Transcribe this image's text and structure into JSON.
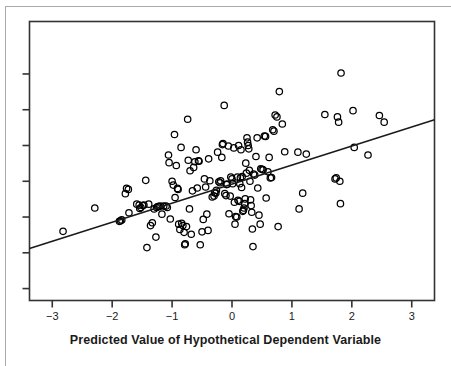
{
  "figure": {
    "kind": "scatterplot-with-regression-line",
    "background_color": "#ffffff",
    "frame_color": "#333333",
    "point_color": "#000000",
    "line_color": "#1a1a1a",
    "page_rule_color": "#a9a9a9"
  },
  "axis": {
    "x_title": "Predicted Value of Hypothetical Dependent Variable",
    "x_tick_labels": [
      "-3",
      "-2",
      "-1",
      "0",
      "1",
      "2",
      "3"
    ],
    "y_tick_labels": [
      "",
      "",
      "",
      "",
      "",
      "",
      ""
    ]
  },
  "chart_data": {
    "type": "scatter",
    "title": "",
    "subtitle": "",
    "xlabel": "Predicted Value of Hypothetical Dependent Variable",
    "ylabel": "",
    "xlim": [
      -3.38,
      3.38
    ],
    "ylim": [
      -2.55,
      3.3
    ],
    "xticks": [
      -3,
      -2,
      -1,
      0,
      1,
      2,
      3
    ],
    "xticklabels": [
      "-3",
      "-2",
      "-1",
      "0",
      "1",
      "2",
      "3"
    ],
    "yticks": [
      -2.3,
      -1.55,
      -0.8,
      -0.05,
      0.7,
      1.45,
      2.2
    ],
    "yticklabels": [
      "",
      "",
      "",
      "",
      "",
      "",
      ""
    ],
    "grid": false,
    "legend": null,
    "n_points": 163,
    "regression_line": {
      "type": "line",
      "x": [
        -3.38,
        3.38
      ],
      "y": [
        -1.46,
        1.24
      ],
      "slope": 0.4,
      "intercept": -0.11
    },
    "points": [
      [
        -2.82,
        -1.1
      ],
      [
        -2.29,
        -0.61
      ],
      [
        -1.88,
        -0.89
      ],
      [
        -1.84,
        -0.86
      ],
      [
        -1.78,
        -0.31
      ],
      [
        -1.76,
        -0.2
      ],
      [
        -1.73,
        -0.22
      ],
      [
        -1.72,
        -0.71
      ],
      [
        -1.59,
        -0.53
      ],
      [
        -1.54,
        -0.62
      ],
      [
        -1.52,
        -0.6
      ],
      [
        -1.49,
        -0.56
      ],
      [
        -1.47,
        -0.55
      ],
      [
        -1.44,
        -0.03
      ],
      [
        -1.42,
        -1.44
      ],
      [
        -1.39,
        -0.53
      ],
      [
        -1.36,
        -0.98
      ],
      [
        -1.33,
        -0.92
      ],
      [
        -1.3,
        -0.63
      ],
      [
        -1.27,
        -1.22
      ],
      [
        -1.26,
        -0.6
      ],
      [
        -1.24,
        -0.58
      ],
      [
        -1.22,
        -0.58
      ],
      [
        -1.2,
        -0.57
      ],
      [
        -1.17,
        -0.74
      ],
      [
        -1.14,
        -0.57
      ],
      [
        -1.1,
        -0.57
      ],
      [
        -1.08,
        -0.6
      ],
      [
        -1.06,
        0.5
      ],
      [
        -1.05,
        0.34
      ],
      [
        -1.03,
        -0.84
      ],
      [
        -1.0,
        -0.05
      ],
      [
        -0.98,
        -0.13
      ],
      [
        -0.96,
        0.93
      ],
      [
        -0.95,
        -0.39
      ],
      [
        -0.93,
        0.28
      ],
      [
        -0.91,
        -0.2
      ],
      [
        -0.9,
        -0.22
      ],
      [
        -0.89,
        -0.95
      ],
      [
        -0.87,
        -1.06
      ],
      [
        -0.85,
        0.66
      ],
      [
        -0.84,
        -0.93
      ],
      [
        -0.82,
        -0.98
      ],
      [
        -0.8,
        -1.12
      ],
      [
        -0.79,
        -1.38
      ],
      [
        -0.78,
        -1.36
      ],
      [
        -0.76,
        -1.0
      ],
      [
        -0.74,
        1.25
      ],
      [
        -0.73,
        0.39
      ],
      [
        -0.71,
        -0.63
      ],
      [
        -0.7,
        0.17
      ],
      [
        -0.68,
        -1.16
      ],
      [
        -0.66,
        -0.25
      ],
      [
        -0.64,
        0.24
      ],
      [
        -0.62,
        0.36
      ],
      [
        -0.6,
        0.61
      ],
      [
        -0.58,
        -0.19
      ],
      [
        -0.56,
        0.38
      ],
      [
        -0.55,
        0.37
      ],
      [
        -0.53,
        -1.38
      ],
      [
        -0.5,
        -1.11
      ],
      [
        -0.48,
        -0.85
      ],
      [
        -0.46,
        0.0
      ],
      [
        -0.44,
        -0.17
      ],
      [
        -0.42,
        -0.74
      ],
      [
        -0.4,
        -1.08
      ],
      [
        -0.39,
        0.42
      ],
      [
        -0.37,
        -0.04
      ],
      [
        -0.33,
        -0.38
      ],
      [
        -0.3,
        -0.36
      ],
      [
        -0.29,
        -0.29
      ],
      [
        -0.27,
        -0.3
      ],
      [
        -0.26,
        -0.24
      ],
      [
        -0.24,
        0.56
      ],
      [
        -0.22,
        -0.06
      ],
      [
        -0.2,
        -0.08
      ],
      [
        -0.19,
        -0.04
      ],
      [
        -0.17,
        0.45
      ],
      [
        -0.16,
        0.72
      ],
      [
        -0.15,
        0.74
      ],
      [
        -0.13,
        1.54
      ],
      [
        -0.12,
        -0.31
      ],
      [
        -0.1,
        -0.35
      ],
      [
        -0.09,
        -0.12
      ],
      [
        -0.08,
        -0.11
      ],
      [
        -0.06,
        0.69
      ],
      [
        -0.05,
        -0.73
      ],
      [
        -0.03,
        -0.36
      ],
      [
        -0.02,
        0.04
      ],
      [
        0.0,
        0.0
      ],
      [
        0.01,
        -0.1
      ],
      [
        0.03,
        0.65
      ],
      [
        0.04,
        -0.49
      ],
      [
        0.05,
        -0.95
      ],
      [
        0.06,
        -0.79
      ],
      [
        0.08,
        -0.8
      ],
      [
        0.09,
        0.04
      ],
      [
        0.1,
        -0.45
      ],
      [
        0.11,
        0.7
      ],
      [
        0.12,
        -0.47
      ],
      [
        0.13,
        -0.1
      ],
      [
        0.14,
        0.02
      ],
      [
        0.15,
        0.61
      ],
      [
        0.16,
        -0.18
      ],
      [
        0.17,
        0.05
      ],
      [
        0.18,
        -0.68
      ],
      [
        0.19,
        -0.66
      ],
      [
        0.2,
        -0.61
      ],
      [
        0.21,
        -0.52
      ],
      [
        0.22,
        -0.42
      ],
      [
        0.23,
        0.33
      ],
      [
        0.24,
        0.12
      ],
      [
        0.25,
        0.86
      ],
      [
        0.26,
        0.77
      ],
      [
        0.27,
        0.7
      ],
      [
        0.28,
        0.63
      ],
      [
        0.29,
        0.18
      ],
      [
        0.3,
        -0.05
      ],
      [
        0.31,
        -0.44
      ],
      [
        0.32,
        -0.56
      ],
      [
        0.33,
        -0.7
      ],
      [
        0.34,
        -1.05
      ],
      [
        0.35,
        -1.42
      ],
      [
        0.36,
        0.1
      ],
      [
        0.38,
        0.08
      ],
      [
        0.4,
        0.47
      ],
      [
        0.42,
        0.86
      ],
      [
        0.43,
        -0.19
      ],
      [
        0.45,
        -0.76
      ],
      [
        0.47,
        -0.95
      ],
      [
        0.48,
        0.21
      ],
      [
        0.5,
        0.2
      ],
      [
        0.52,
        0.19
      ],
      [
        0.54,
        0.9
      ],
      [
        0.56,
        0.89
      ],
      [
        0.57,
        -0.4
      ],
      [
        0.6,
        0.15
      ],
      [
        0.62,
        0.45
      ],
      [
        0.64,
        0.02
      ],
      [
        0.66,
        0.03
      ],
      [
        0.68,
        1.03
      ],
      [
        0.7,
        1.0
      ],
      [
        0.72,
        1.34
      ],
      [
        0.75,
        1.3
      ],
      [
        0.77,
        -1.0
      ],
      [
        0.79,
        1.83
      ],
      [
        0.84,
        1.15
      ],
      [
        0.88,
        0.57
      ],
      [
        1.1,
        0.56
      ],
      [
        1.12,
        -0.63
      ],
      [
        1.18,
        -0.3
      ],
      [
        1.24,
        0.52
      ],
      [
        1.55,
        1.35
      ],
      [
        1.72,
        0.0
      ],
      [
        1.74,
        0.02
      ],
      [
        1.76,
        1.3
      ],
      [
        1.78,
        1.19
      ],
      [
        1.8,
        -0.05
      ],
      [
        1.81,
        -0.52
      ],
      [
        1.82,
        2.22
      ],
      [
        2.02,
        1.43
      ],
      [
        2.04,
        0.66
      ],
      [
        2.27,
        0.5
      ],
      [
        2.46,
        1.33
      ],
      [
        2.54,
        1.19
      ],
      [
        -1.86,
        -0.88
      ],
      [
        -1.55,
        -0.55
      ]
    ]
  }
}
